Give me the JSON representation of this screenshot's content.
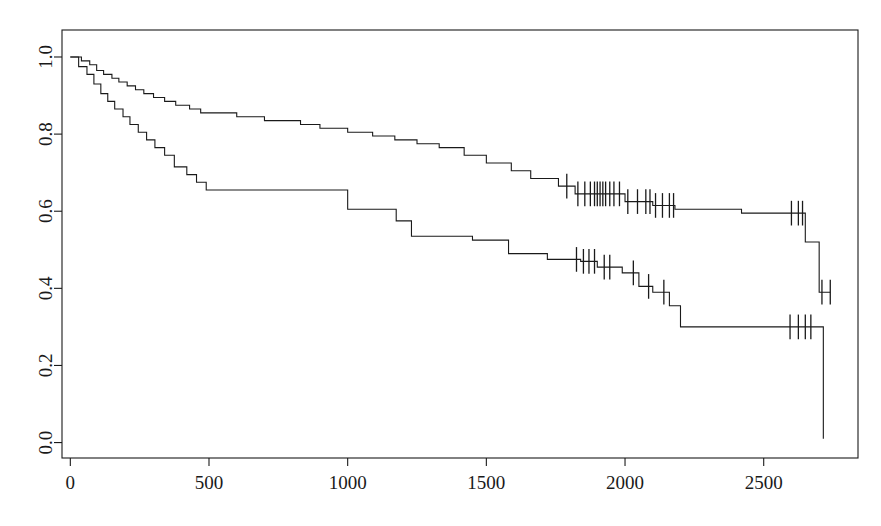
{
  "figure": {
    "title": "",
    "background": "#ffffff",
    "foreground": "#1a1a1a"
  },
  "chart_data": {
    "type": "line",
    "subtype": "kaplan-meier-step",
    "title": "",
    "subtitle": "",
    "xlabel": "",
    "ylabel": "",
    "xlim": [
      -30,
      2840
    ],
    "ylim": [
      -0.04,
      1.07
    ],
    "grid": false,
    "legend": null,
    "legend_position": "none",
    "xticks": [
      0,
      500,
      1000,
      1500,
      2000,
      2500
    ],
    "xticklabels": [
      "0",
      "500",
      "1000",
      "1500",
      "2000",
      "2500"
    ],
    "yticks": [
      0.0,
      0.2,
      0.4,
      0.6,
      0.8,
      1.0
    ],
    "yticklabels": [
      "0.0",
      "0.2",
      "0.4",
      "0.6",
      "0.8",
      "1.0"
    ],
    "ytick_label_rotation": 90,
    "line_color": "#1a1a1a",
    "line_width": 1.1,
    "series": [
      {
        "name": "upper-curve",
        "step": "post",
        "x": [
          0,
          40,
          70,
          95,
          120,
          150,
          175,
          205,
          235,
          265,
          300,
          340,
          380,
          430,
          470,
          600,
          700,
          830,
          900,
          1000,
          1090,
          1170,
          1250,
          1330,
          1420,
          1500,
          1590,
          1660,
          1760,
          1820,
          2000,
          2100,
          2180,
          2420,
          2650,
          2700,
          2740
        ],
        "y": [
          1.0,
          0.99,
          0.98,
          0.965,
          0.955,
          0.945,
          0.935,
          0.925,
          0.915,
          0.905,
          0.895,
          0.885,
          0.875,
          0.865,
          0.855,
          0.845,
          0.835,
          0.825,
          0.815,
          0.805,
          0.795,
          0.785,
          0.775,
          0.765,
          0.745,
          0.725,
          0.705,
          0.685,
          0.665,
          0.645,
          0.625,
          0.615,
          0.605,
          0.595,
          0.52,
          0.39,
          0.39
        ],
        "censor_x": [
          1790,
          1830,
          1855,
          1875,
          1890,
          1900,
          1910,
          1920,
          1930,
          1945,
          1960,
          1980,
          2010,
          2045,
          2075,
          2090,
          2110,
          2135,
          2160,
          2175,
          2600,
          2625,
          2640,
          2710,
          2740
        ],
        "final_value": 0.39
      },
      {
        "name": "lower-curve",
        "step": "post",
        "x": [
          0,
          30,
          60,
          85,
          110,
          135,
          160,
          190,
          215,
          245,
          275,
          305,
          340,
          375,
          420,
          455,
          490,
          850,
          1000,
          1175,
          1230,
          1450,
          1580,
          1720,
          1840,
          1900,
          1990,
          2050,
          2100,
          2160,
          2200,
          2680,
          2710,
          2715
        ],
        "y": [
          1.0,
          0.975,
          0.955,
          0.93,
          0.905,
          0.885,
          0.865,
          0.845,
          0.825,
          0.805,
          0.785,
          0.765,
          0.745,
          0.715,
          0.695,
          0.675,
          0.655,
          0.655,
          0.605,
          0.575,
          0.535,
          0.525,
          0.49,
          0.475,
          0.47,
          0.455,
          0.44,
          0.405,
          0.39,
          0.355,
          0.3,
          0.3,
          0.3,
          0.01
        ],
        "censor_x": [
          1825,
          1850,
          1870,
          1890,
          1925,
          1945,
          2030,
          2085,
          2140,
          2595,
          2625,
          2650,
          2670
        ],
        "final_value": 0.01
      }
    ],
    "censor_mark": {
      "style": "vertical-tick",
      "half_height_units": 0.032
    }
  }
}
